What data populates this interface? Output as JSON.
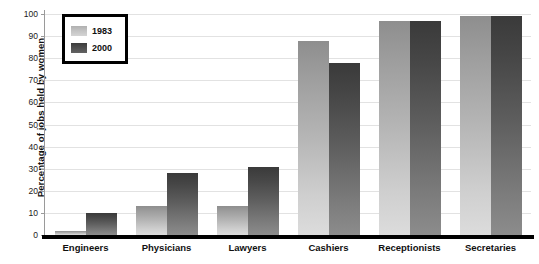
{
  "chart_data": {
    "type": "bar",
    "title": "",
    "xlabel": "",
    "ylabel": "Percentage of jobs held by women",
    "ylim": [
      0,
      100
    ],
    "yticks": [
      0,
      10,
      20,
      30,
      40,
      50,
      60,
      70,
      80,
      90,
      100
    ],
    "grid": true,
    "legend_position": "top-left",
    "categories": [
      "Engineers",
      "Physicians",
      "Lawyers",
      "Cashiers",
      "Receptionists",
      "Secretaries"
    ],
    "series": [
      {
        "name": "1983",
        "color": "#c0c0c0",
        "values": [
          2,
          13,
          13,
          88,
          97,
          99
        ]
      },
      {
        "name": "2000",
        "color": "#4d4d4d",
        "values": [
          10,
          28,
          31,
          78,
          97,
          99
        ]
      }
    ]
  },
  "legend": {
    "items": [
      {
        "label": "1983"
      },
      {
        "label": "2000"
      }
    ]
  }
}
